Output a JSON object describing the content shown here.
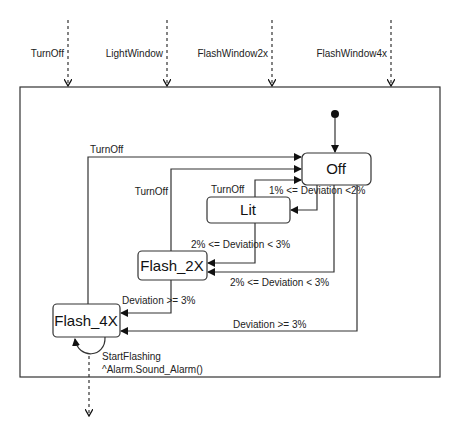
{
  "diagram": {
    "type": "state-machine",
    "external_events": [
      {
        "label": "TurnOff",
        "x": 68
      },
      {
        "label": "LightWindow",
        "x": 167
      },
      {
        "label": "FlashWindow2x",
        "x": 272
      },
      {
        "label": "FlashWindow4x",
        "x": 391
      }
    ],
    "states": {
      "off": "Off",
      "lit": "Lit",
      "flash2x": "Flash_2X",
      "flash4x": "Flash_4X"
    },
    "transitions": {
      "flash4x_to_off": "TurnOff",
      "flash2x_to_off": "TurnOff",
      "lit_to_off": "TurnOff",
      "off_to_lit": "1% <= Deviation <2%",
      "lit_to_flash2x": "2% <= Deviation < 3%",
      "off_to_flash2x": "2% <= Deviation < 3%",
      "flash2x_to_flash4x": "Deviation >= 3%",
      "off_to_flash4x": "Deviation >= 3%",
      "flash4x_self_line1": "StartFlashing",
      "flash4x_self_line2": "^Alarm.Sound_Alarm()"
    }
  }
}
